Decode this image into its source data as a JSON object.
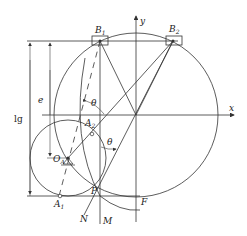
{
  "diagram": {
    "labels": {
      "B1": "B",
      "B1_sub": "1",
      "B2": "B",
      "B2_sub": "2",
      "y_axis": "y",
      "x_axis": "x",
      "e": "e",
      "lg": "lg",
      "theta_upper": "θ",
      "theta_lower": "θ",
      "OA": "O",
      "OA_sub": "A",
      "A2": "A",
      "A2_sub": "2",
      "A1": "A",
      "A1_sub": "1",
      "P": "P",
      "N": "N",
      "M": "M",
      "F": "F"
    },
    "colors": {
      "stroke": "#333333",
      "background": "#ffffff"
    }
  }
}
